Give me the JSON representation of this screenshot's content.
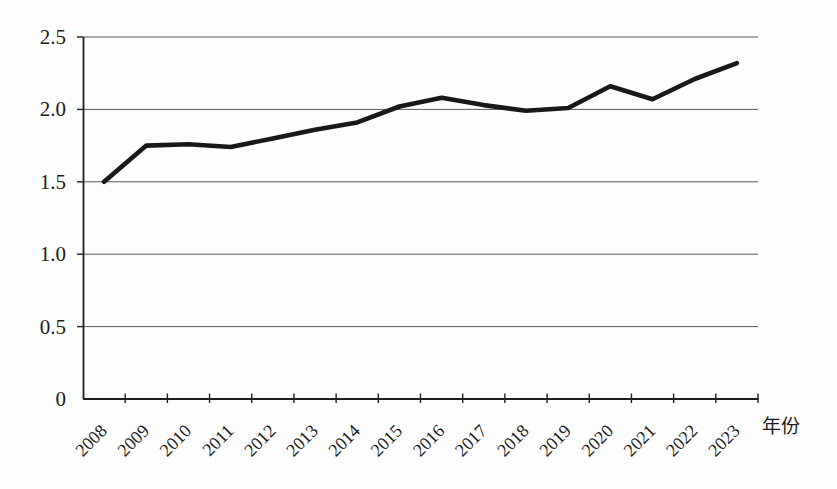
{
  "figure": {
    "background": "#fdfdfd",
    "text_color": "#1b1b1b",
    "gridline_color": "#5a5a5a",
    "axis_color": "#1f1f1f"
  },
  "chart_data": {
    "type": "line",
    "title": "",
    "xlabel": "年份",
    "ylabel": "",
    "categories": [
      "2008",
      "2009",
      "2010",
      "2011",
      "2012",
      "2013",
      "2014",
      "2015",
      "2016",
      "2017",
      "2018",
      "2019",
      "2020",
      "2021",
      "2022",
      "2023"
    ],
    "values": [
      1.5,
      1.75,
      1.76,
      1.74,
      1.8,
      1.86,
      1.91,
      2.02,
      2.08,
      2.03,
      1.99,
      2.01,
      2.16,
      2.07,
      2.21,
      2.32
    ],
    "ylim": [
      0,
      2.5
    ],
    "ytick_step": 0.5,
    "ytick_labels": [
      "0",
      "0.5",
      "1.0",
      "1.5",
      "2.0",
      "2.5"
    ],
    "grid": true,
    "legend": "none",
    "xtick_rotation_deg": -45,
    "line_color": "#191919",
    "line_width": 4.6
  }
}
